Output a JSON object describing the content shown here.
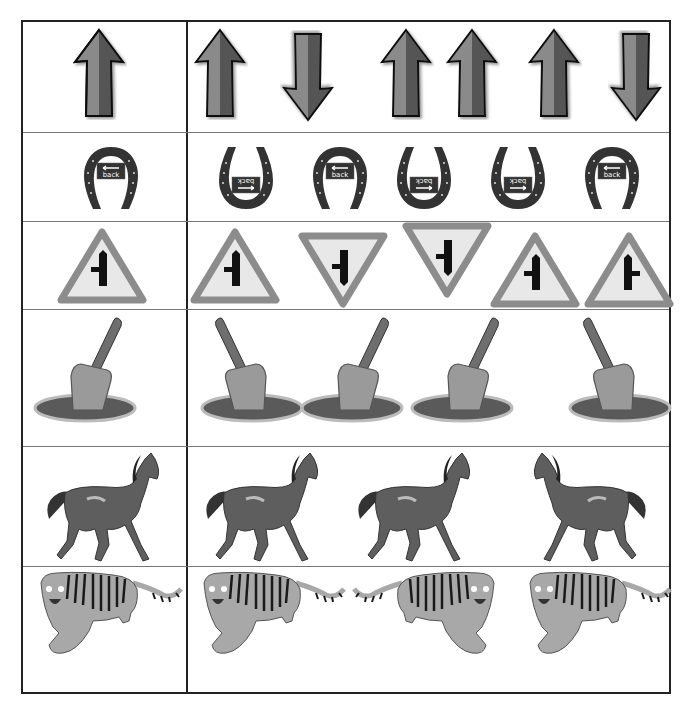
{
  "worksheet": {
    "type": "visual-discrimination",
    "layout": {
      "columns": [
        "reference",
        "options"
      ]
    },
    "rows": [
      {
        "subject": "arrow",
        "reference": {
          "icon": "arrow-up-icon",
          "orientation": "up"
        },
        "options": [
          {
            "icon": "arrow-up-icon",
            "orientation": "up"
          },
          {
            "icon": "arrow-down-icon",
            "orientation": "down"
          },
          {
            "icon": "arrow-up-icon",
            "orientation": "up"
          },
          {
            "icon": "arrow-up-icon",
            "orientation": "up"
          },
          {
            "icon": "arrow-up-icon",
            "orientation": "up"
          },
          {
            "icon": "arrow-down-icon",
            "orientation": "down"
          }
        ]
      },
      {
        "subject": "horseshoe",
        "reference": {
          "icon": "horseshoe-icon",
          "orientation": "upright",
          "sign_text": "back"
        },
        "options": [
          {
            "icon": "horseshoe-icon",
            "orientation": "inverted",
            "sign_text": "back"
          },
          {
            "icon": "horseshoe-icon",
            "orientation": "upright",
            "sign_text": "back"
          },
          {
            "icon": "horseshoe-icon",
            "orientation": "inverted",
            "sign_text": "back"
          },
          {
            "icon": "horseshoe-icon",
            "orientation": "inverted",
            "sign_text": "back"
          },
          {
            "icon": "horseshoe-icon",
            "orientation": "upright",
            "sign_text": "back"
          }
        ]
      },
      {
        "subject": "road-sign",
        "reference": {
          "icon": "side-road-sign-icon",
          "orientation": "upright",
          "branch": "left"
        },
        "options": [
          {
            "icon": "side-road-sign-icon",
            "orientation": "upright",
            "branch": "left"
          },
          {
            "icon": "side-road-sign-icon",
            "orientation": "inverted",
            "branch": "left"
          },
          {
            "icon": "side-road-sign-icon",
            "orientation": "inverted",
            "branch": "left"
          },
          {
            "icon": "side-road-sign-icon",
            "orientation": "upright",
            "branch": "left"
          },
          {
            "icon": "side-road-sign-icon",
            "orientation": "upright",
            "branch": "right"
          }
        ]
      },
      {
        "subject": "shovel",
        "reference": {
          "icon": "shovel-icon",
          "facing": "right"
        },
        "options": [
          {
            "icon": "shovel-icon",
            "facing": "left"
          },
          {
            "icon": "shovel-icon",
            "facing": "right"
          },
          {
            "icon": "shovel-icon",
            "facing": "right"
          },
          {
            "icon": "shovel-icon",
            "facing": "left"
          }
        ]
      },
      {
        "subject": "horse",
        "reference": {
          "icon": "horse-icon",
          "facing": "right"
        },
        "options": [
          {
            "icon": "horse-icon",
            "facing": "right"
          },
          {
            "icon": "horse-icon",
            "facing": "right"
          },
          {
            "icon": "horse-icon",
            "facing": "left"
          }
        ]
      },
      {
        "subject": "tiger",
        "reference": {
          "icon": "tiger-icon",
          "facing": "left"
        },
        "options": [
          {
            "icon": "tiger-icon",
            "facing": "left"
          },
          {
            "icon": "tiger-icon",
            "facing": "right"
          },
          {
            "icon": "tiger-icon",
            "facing": "left"
          }
        ]
      }
    ],
    "colors": {
      "border": "#222222",
      "row_divider": "#777777",
      "arrow_light": "#8a8a8a",
      "arrow_dark": "#555555",
      "horseshoe": "#333333",
      "sign_border": "#8c8c8c",
      "sign_fill": "#e8e8e8",
      "sign_symbol": "#111111",
      "shovel_blade": "#9a9a9a",
      "shovel_handle": "#6e6e6e",
      "soil": "#5a5a5a",
      "horse": "#5e5e5e",
      "tiger_body": "#a8a8a8",
      "tiger_stripe": "#1a1a1a"
    }
  }
}
